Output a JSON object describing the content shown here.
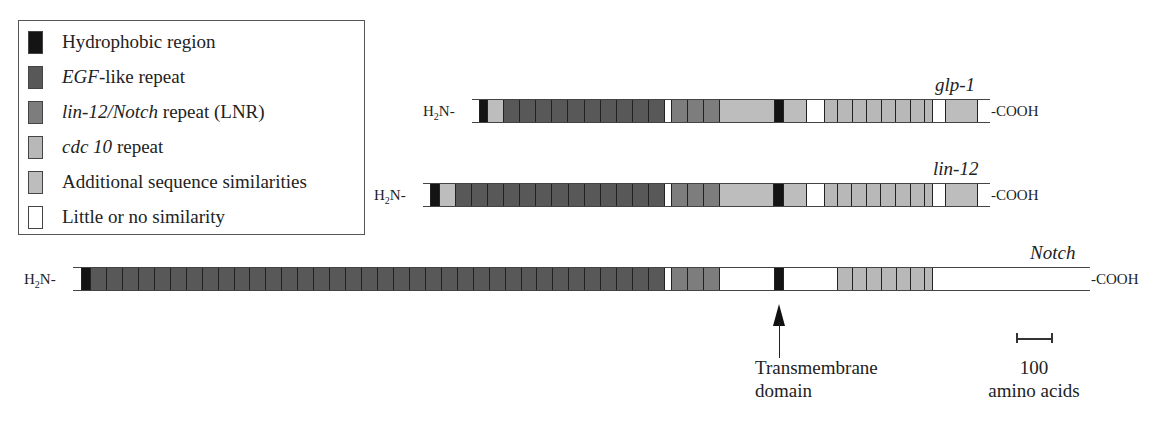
{
  "colors": {
    "hydrophobic": "#141414",
    "egf": "#585858",
    "lnr": "#7d7d7d",
    "cdc10": "#b8b8b8",
    "additional": "#bdbdbd",
    "none": "#ffffff"
  },
  "legend": {
    "items": [
      {
        "key": "hydrophobic",
        "label": "Hydrophobic region",
        "italic_prefix": "",
        "rest": "Hydrophobic region"
      },
      {
        "key": "egf",
        "label": "EGF-like repeat",
        "italic_prefix": "EGF",
        "rest": "-like repeat"
      },
      {
        "key": "lnr",
        "label": "lin-12/Notch repeat (LNR)",
        "italic_prefix": "lin-12/Notch",
        "rest": " repeat (LNR)"
      },
      {
        "key": "cdc10",
        "label": "cdc 10 repeat",
        "italic_prefix": "cdc 10",
        "rest": " repeat"
      },
      {
        "key": "additional",
        "label": "Additional sequence similarities",
        "italic_prefix": "",
        "rest": "Additional sequence similarities"
      },
      {
        "key": "none",
        "label": "Little or no similarity",
        "italic_prefix": "",
        "rest": "Little or no similarity"
      }
    ]
  },
  "proteins": [
    {
      "name": "glp-1",
      "n_term": "H2N-",
      "c_term": "-COOH",
      "top": 99,
      "start": 472,
      "end": 990,
      "label_x": 935,
      "label_y": 74,
      "segments": [
        {
          "type": "none",
          "x0": 472,
          "x1": 479
        },
        {
          "type": "hydrophobic",
          "x0": 479,
          "x1": 487
        },
        {
          "type": "additional",
          "x0": 487,
          "x1": 503
        },
        {
          "type": "egf",
          "x0": 503,
          "x1": 664,
          "repeats": 10
        },
        {
          "type": "none",
          "x0": 664,
          "x1": 671
        },
        {
          "type": "lnr",
          "x0": 671,
          "x1": 719,
          "repeats": 3
        },
        {
          "type": "additional",
          "x0": 719,
          "x1": 774
        },
        {
          "type": "hydrophobic",
          "x0": 774,
          "x1": 783
        },
        {
          "type": "additional",
          "x0": 783,
          "x1": 806
        },
        {
          "type": "none",
          "x0": 806,
          "x1": 824
        },
        {
          "type": "cdc10",
          "x0": 824,
          "x1": 932,
          "dividers": [
            837,
            852,
            866,
            881,
            895,
            910,
            924
          ]
        },
        {
          "type": "none",
          "x0": 932,
          "x1": 945
        },
        {
          "type": "additional",
          "x0": 945,
          "x1": 977
        },
        {
          "type": "none",
          "x0": 977,
          "x1": 990
        }
      ]
    },
    {
      "name": "lin-12",
      "n_term": "H2N-",
      "c_term": "-COOH",
      "top": 183,
      "start": 423,
      "end": 990,
      "label_x": 933,
      "label_y": 158,
      "segments": [
        {
          "type": "none",
          "x0": 423,
          "x1": 430
        },
        {
          "type": "hydrophobic",
          "x0": 430,
          "x1": 439
        },
        {
          "type": "additional",
          "x0": 439,
          "x1": 455
        },
        {
          "type": "egf",
          "x0": 455,
          "x1": 664,
          "repeats": 13
        },
        {
          "type": "none",
          "x0": 664,
          "x1": 671
        },
        {
          "type": "lnr",
          "x0": 671,
          "x1": 719,
          "repeats": 3
        },
        {
          "type": "additional",
          "x0": 719,
          "x1": 773
        },
        {
          "type": "hydrophobic",
          "x0": 773,
          "x1": 783
        },
        {
          "type": "additional",
          "x0": 783,
          "x1": 806
        },
        {
          "type": "none",
          "x0": 806,
          "x1": 824
        },
        {
          "type": "cdc10",
          "x0": 824,
          "x1": 932,
          "dividers": [
            837,
            851,
            866,
            880,
            895,
            910,
            924
          ]
        },
        {
          "type": "none",
          "x0": 932,
          "x1": 945
        },
        {
          "type": "additional",
          "x0": 945,
          "x1": 977
        },
        {
          "type": "none",
          "x0": 977,
          "x1": 990
        }
      ]
    },
    {
      "name": "Notch",
      "n_term": "H2N-",
      "c_term": "-COOH",
      "top": 267,
      "start": 73,
      "end": 1090,
      "label_x": 1030,
      "label_y": 242,
      "segments": [
        {
          "type": "none",
          "x0": 73,
          "x1": 81
        },
        {
          "type": "hydrophobic",
          "x0": 81,
          "x1": 90
        },
        {
          "type": "egf",
          "x0": 90,
          "x1": 664,
          "repeats": 36
        },
        {
          "type": "none",
          "x0": 664,
          "x1": 671
        },
        {
          "type": "lnr",
          "x0": 671,
          "x1": 719,
          "repeats": 3
        },
        {
          "type": "none",
          "x0": 719,
          "x1": 774
        },
        {
          "type": "hydrophobic",
          "x0": 774,
          "x1": 783
        },
        {
          "type": "none",
          "x0": 783,
          "x1": 837
        },
        {
          "type": "cdc10",
          "x0": 837,
          "x1": 932,
          "dividers": [
            852,
            866,
            881,
            896,
            910,
            924
          ]
        },
        {
          "type": "none",
          "x0": 932,
          "x1": 1090
        }
      ]
    }
  ],
  "annotations": {
    "transmembrane": {
      "line1": "Transmembrane",
      "line2": "domain",
      "arrow_x": 779
    },
    "scale": {
      "value": "100",
      "unit": "amino acids",
      "x0": 1016,
      "x1": 1052
    }
  }
}
